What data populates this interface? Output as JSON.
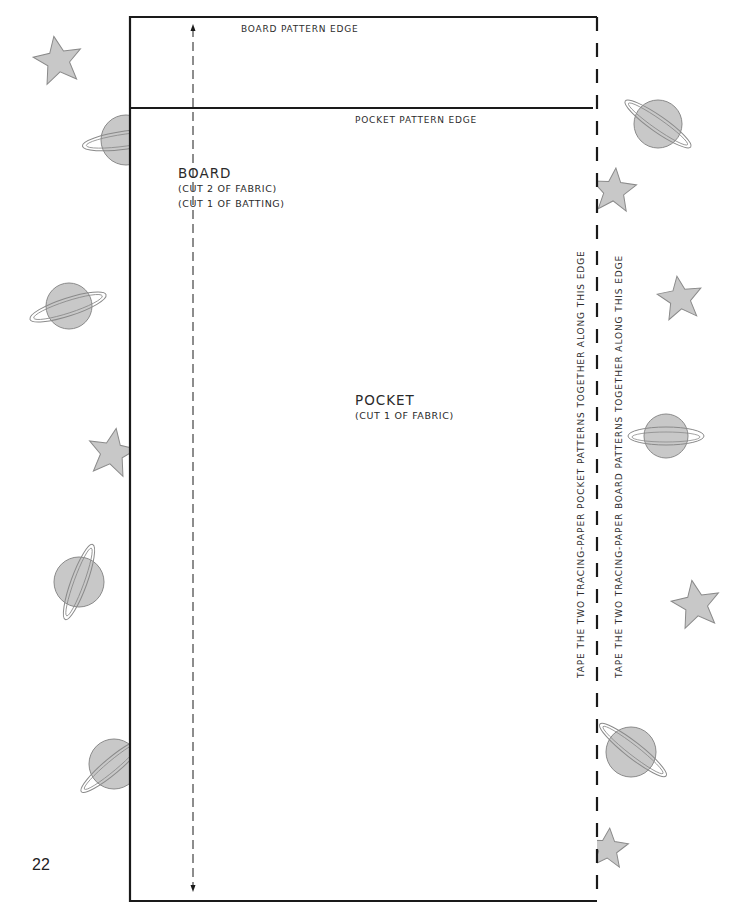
{
  "page": {
    "number": "22"
  },
  "pattern": {
    "board_edge_label": "BOARD PATTERN EDGE",
    "pocket_edge_label": "POCKET PATTERN EDGE",
    "board": {
      "title": "BOARD",
      "instructions": [
        "(CUT 2 OF FABRIC)",
        "(CUT 1 OF BATTING)"
      ]
    },
    "pocket": {
      "title": "POCKET",
      "instructions": [
        "(CUT 1 OF FABRIC)"
      ]
    },
    "tape_instructions": {
      "pocket": "TAPE THE TWO TRACING-PAPER POCKET PATTERNS TOGETHER ALONG THIS EDGE",
      "board": "TAPE THE TWO TRACING-PAPER BOARD PATTERNS TOGETHER ALONG THIS EDGE"
    },
    "grainline": "grainline-arrow (double-headed, dashed)"
  },
  "decorations": {
    "icons": [
      "star-icon",
      "planet-icon"
    ],
    "fill_color": "#c8c8c8",
    "stroke_color": "#8a8a8a",
    "line_color": "#1a1a1a"
  }
}
